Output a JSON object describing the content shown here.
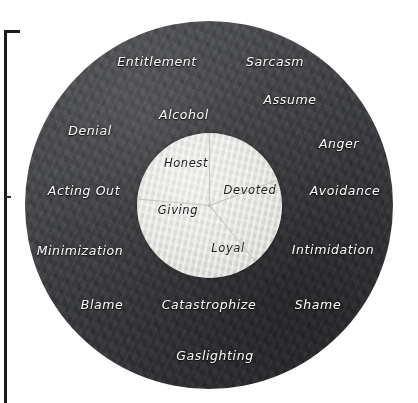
{
  "figure": {
    "type": "concentric-circle-diagram",
    "center": {
      "x": 210,
      "y": 205
    },
    "outer_ring": {
      "name": "outer-ring",
      "fill_color": "#3a3b3e",
      "text_color": "#ffffff",
      "radius": 184,
      "labels": [
        {
          "text": "Entitlement",
          "x": 157,
          "y": 61
        },
        {
          "text": "Sarcasm",
          "x": 275,
          "y": 61
        },
        {
          "text": "Assume",
          "x": 290,
          "y": 99
        },
        {
          "text": "Alcohol",
          "x": 184,
          "y": 114
        },
        {
          "text": "Denial",
          "x": 90,
          "y": 130
        },
        {
          "text": "Anger",
          "x": 339,
          "y": 143
        },
        {
          "text": "Acting Out",
          "x": 84,
          "y": 190
        },
        {
          "text": "Avoidance",
          "x": 345,
          "y": 190
        },
        {
          "text": "Minimization",
          "x": 80,
          "y": 250
        },
        {
          "text": "Intimidation",
          "x": 333,
          "y": 249
        },
        {
          "text": "Blame",
          "x": 102,
          "y": 304
        },
        {
          "text": "Catastrophize",
          "x": 209,
          "y": 304
        },
        {
          "text": "Shame",
          "x": 318,
          "y": 304
        },
        {
          "text": "Gaslighting",
          "x": 215,
          "y": 355
        }
      ]
    },
    "inner_circle": {
      "name": "inner-circle",
      "fill_color": "#e6e5e2",
      "text_color": "#1c1c1c",
      "radius": 72,
      "labels": [
        {
          "text": "Honest",
          "x": 186,
          "y": 163
        },
        {
          "text": "Devoted",
          "x": 250,
          "y": 190
        },
        {
          "text": "Giving",
          "x": 178,
          "y": 210
        },
        {
          "text": "Loyal",
          "x": 228,
          "y": 248
        }
      ],
      "wedges": [
        {
          "name": "honest",
          "start_deg": 180,
          "end_deg": 270
        },
        {
          "name": "devoted",
          "start_deg": 270,
          "end_deg": 20
        },
        {
          "name": "loyal",
          "start_deg": 20,
          "end_deg": 90
        },
        {
          "name": "giving",
          "start_deg": 90,
          "end_deg": 180
        }
      ],
      "divider_color": "#c7c6c2"
    },
    "frame": {
      "name": "page-border-frame",
      "color": "#1b1b1b"
    }
  }
}
